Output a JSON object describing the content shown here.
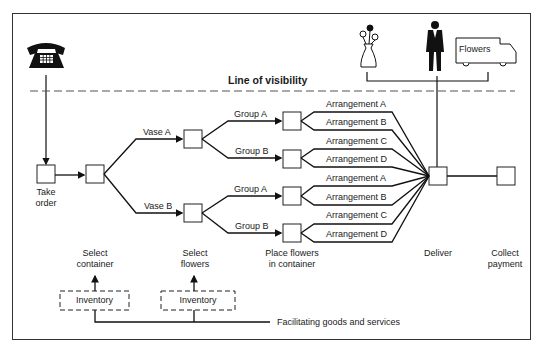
{
  "diagram": {
    "line_of_visibility": "Line of visibility",
    "truck_label": "Flowers",
    "steps": {
      "take_order": [
        "Take",
        "order"
      ],
      "select_container": [
        "Select",
        "container"
      ],
      "select_flowers": [
        "Select",
        "flowers"
      ],
      "place_flowers": [
        "Place flowers",
        "in container"
      ],
      "deliver": "Deliver",
      "collect_payment": [
        "Collect",
        "payment"
      ]
    },
    "vases": [
      "Vase A",
      "Vase B"
    ],
    "groups": [
      "Group A",
      "Group B",
      "Group A",
      "Group B"
    ],
    "arrangements": [
      "Arrangement A",
      "Arrangement B",
      "Arrangement C",
      "Arrangement D",
      "Arrangement A",
      "Arrangement B",
      "Arrangement C",
      "Arrangement D"
    ],
    "inventory": [
      "Inventory",
      "Inventory"
    ],
    "facilitating": "Facilitating goods and services",
    "icons": [
      "telephone-icon",
      "flower-vase-icon",
      "delivery-person-icon",
      "delivery-truck-icon"
    ]
  }
}
